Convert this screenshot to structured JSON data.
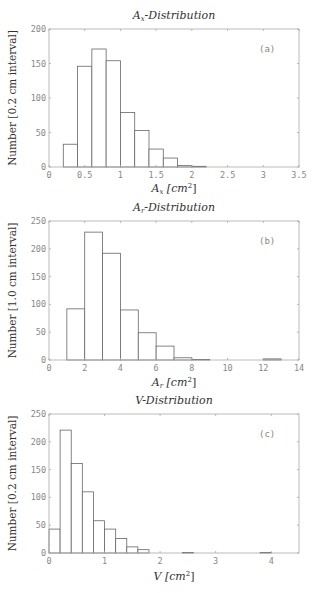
{
  "chart_data": [
    {
      "type": "bar",
      "panel_label": "(a)",
      "title": "A_x-Distribution",
      "title_main": "A",
      "title_sub": "x",
      "title_rest": "-Distribution",
      "xlabel": "A_x [cm^2]",
      "xlabel_main": "A",
      "xlabel_sub": "x",
      "xlabel_unit": "[cm",
      "xlabel_sup": "2",
      "xlabel_close": "]",
      "ylabel": "Number [0.2 cm interval]",
      "xlim": [
        0,
        3.5
      ],
      "ylim": [
        0,
        200
      ],
      "xticks": [
        0,
        0.5,
        1,
        1.5,
        2,
        2.5,
        3,
        3.5
      ],
      "xtick_labels": [
        "0",
        "0.5",
        "1",
        "1.5",
        "2",
        "2.5",
        "3",
        "3.5"
      ],
      "yticks": [
        0,
        50,
        100,
        150,
        200
      ],
      "bin_width": 0.2,
      "bin_edges": [
        0.2,
        0.4,
        0.6,
        0.8,
        1.0,
        1.2,
        1.4,
        1.6,
        1.8,
        2.0,
        2.2
      ],
      "values": [
        33,
        146,
        171,
        154,
        79,
        53,
        26,
        13,
        2,
        1
      ],
      "grid": false
    },
    {
      "type": "bar",
      "panel_label": "(b)",
      "title": "A_r-Distribution",
      "title_main": "A",
      "title_sub": "r",
      "title_rest": "-Distribution",
      "xlabel": "A_r [cm^2]",
      "xlabel_main": "A",
      "xlabel_sub": "r",
      "xlabel_unit": "[cm",
      "xlabel_sup": "2",
      "xlabel_close": "]",
      "ylabel": "Number [1.0 cm interval]",
      "xlim": [
        0,
        14
      ],
      "ylim": [
        0,
        250
      ],
      "xticks": [
        0,
        2,
        4,
        6,
        8,
        10,
        12,
        14
      ],
      "xtick_labels": [
        "0",
        "2",
        "4",
        "6",
        "8",
        "10",
        "12",
        "14"
      ],
      "yticks": [
        0,
        50,
        100,
        150,
        200,
        250
      ],
      "bin_width": 1.0,
      "bin_edges": [
        1,
        2,
        3,
        4,
        5,
        6,
        7,
        8,
        9,
        10,
        11,
        12,
        13
      ],
      "values": [
        92,
        230,
        192,
        90,
        49,
        25,
        4,
        1,
        0,
        0,
        0,
        2
      ],
      "grid": false
    },
    {
      "type": "bar",
      "panel_label": "(c)",
      "title": "V-Distribution",
      "title_main": "V",
      "title_sub": "",
      "title_rest": "-Distribution",
      "xlabel": "V [cm^2]",
      "xlabel_main": "V",
      "xlabel_sub": "",
      "xlabel_unit": "[cm",
      "xlabel_sup": "2",
      "xlabel_close": "]",
      "ylabel": "Number [0.2 cm interval]",
      "xlim": [
        0,
        4.5
      ],
      "ylim": [
        0,
        250
      ],
      "xticks": [
        0,
        1,
        2,
        3,
        4
      ],
      "xtick_labels": [
        "0",
        "1",
        "2",
        "3",
        "4"
      ],
      "yticks": [
        0,
        50,
        100,
        150,
        200,
        250
      ],
      "bin_width": 0.2,
      "bin_edges": [
        0,
        0.2,
        0.4,
        0.6,
        0.8,
        1.0,
        1.2,
        1.4,
        1.6,
        1.8,
        2.0,
        2.2,
        2.4,
        2.6,
        2.8,
        3.0,
        3.2,
        3.4,
        3.6,
        3.8,
        4.0
      ],
      "values": [
        43,
        221,
        161,
        110,
        58,
        43,
        26,
        11,
        6,
        0,
        0,
        0,
        1,
        0,
        0,
        0,
        0,
        0,
        0,
        1
      ],
      "grid": false
    }
  ]
}
